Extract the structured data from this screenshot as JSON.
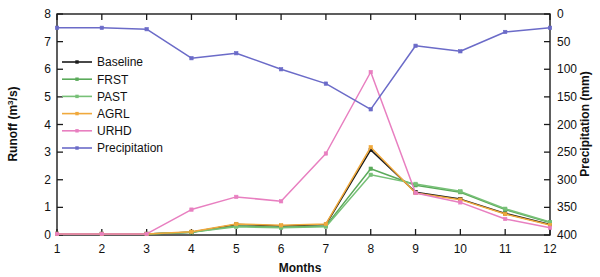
{
  "chart_data": {
    "type": "line",
    "title": "",
    "xlabel": "Months",
    "ylabel": "Runoff (m³/s)",
    "y2label": "Precipitation (mm)",
    "x": [
      1,
      2,
      3,
      4,
      5,
      6,
      7,
      8,
      9,
      10,
      11,
      12
    ],
    "xticklabels": [
      "1",
      "2",
      "3",
      "4",
      "5",
      "6",
      "7",
      "8",
      "9",
      "10",
      "11",
      "12"
    ],
    "xlim": [
      1,
      12
    ],
    "ylim": [
      0,
      8
    ],
    "yticks": [
      0,
      1,
      2,
      3,
      4,
      5,
      6,
      7,
      8
    ],
    "yticklabels": [
      "0",
      "1",
      "2",
      "3",
      "4",
      "5",
      "6",
      "7",
      "8"
    ],
    "y2lim": [
      400,
      0
    ],
    "y2ticks": [
      0,
      50,
      100,
      150,
      200,
      250,
      300,
      350,
      400
    ],
    "y2ticklabels": [
      "0",
      "50",
      "100",
      "150",
      "200",
      "250",
      "300",
      "350",
      "400"
    ],
    "y2_reversed": true,
    "grid": false,
    "legend_position": "upper left inside",
    "series": [
      {
        "name": "Baseline",
        "axis": "left",
        "color": "#1a1a1a",
        "marker": "square",
        "values": [
          0.04,
          0.04,
          0.04,
          0.1,
          0.38,
          0.33,
          0.38,
          3.08,
          1.55,
          1.3,
          0.78,
          0.38
        ]
      },
      {
        "name": "FRST",
        "axis": "left",
        "color": "#5aaa5a",
        "marker": "square",
        "values": [
          0.04,
          0.04,
          0.04,
          0.1,
          0.33,
          0.28,
          0.33,
          2.4,
          1.8,
          1.55,
          0.92,
          0.45
        ]
      },
      {
        "name": "PAST",
        "axis": "left",
        "color": "#77c077",
        "marker": "square",
        "values": [
          0.04,
          0.04,
          0.04,
          0.1,
          0.3,
          0.26,
          0.3,
          2.18,
          1.85,
          1.58,
          0.95,
          0.47
        ]
      },
      {
        "name": "AGRL",
        "axis": "left",
        "color": "#f0a93c",
        "marker": "square",
        "values": [
          0.04,
          0.04,
          0.04,
          0.12,
          0.4,
          0.35,
          0.4,
          3.18,
          1.52,
          1.28,
          0.76,
          0.36
        ]
      },
      {
        "name": "URHD",
        "axis": "left",
        "color": "#e87fc0",
        "marker": "square",
        "values": [
          0.04,
          0.04,
          0.04,
          0.92,
          1.38,
          1.22,
          2.95,
          5.9,
          1.52,
          1.18,
          0.58,
          0.26
        ]
      },
      {
        "name": "Precipitation",
        "axis": "right",
        "color": "#6b6bc8",
        "marker": "square",
        "values_mm": [
          25,
          25,
          28,
          80,
          71,
          100,
          126,
          172,
          57,
          67,
          32,
          25
        ],
        "values_left_scale": [
          7.5,
          7.5,
          7.45,
          6.4,
          6.58,
          6.0,
          5.48,
          4.55,
          6.85,
          6.65,
          7.35,
          7.5
        ]
      }
    ]
  },
  "legend": {
    "items": [
      {
        "label": "Baseline",
        "color": "#1a1a1a"
      },
      {
        "label": "FRST",
        "color": "#5aaa5a"
      },
      {
        "label": "PAST",
        "color": "#77c077"
      },
      {
        "label": "AGRL",
        "color": "#f0a93c"
      },
      {
        "label": "URHD",
        "color": "#e87fc0"
      },
      {
        "label": "Precipitation",
        "color": "#6b6bc8"
      }
    ]
  },
  "axes": {
    "x_title": "Months",
    "y_left_title_html": "Runoff (m³/s)",
    "y_right_title": "Precipitation (mm)"
  }
}
